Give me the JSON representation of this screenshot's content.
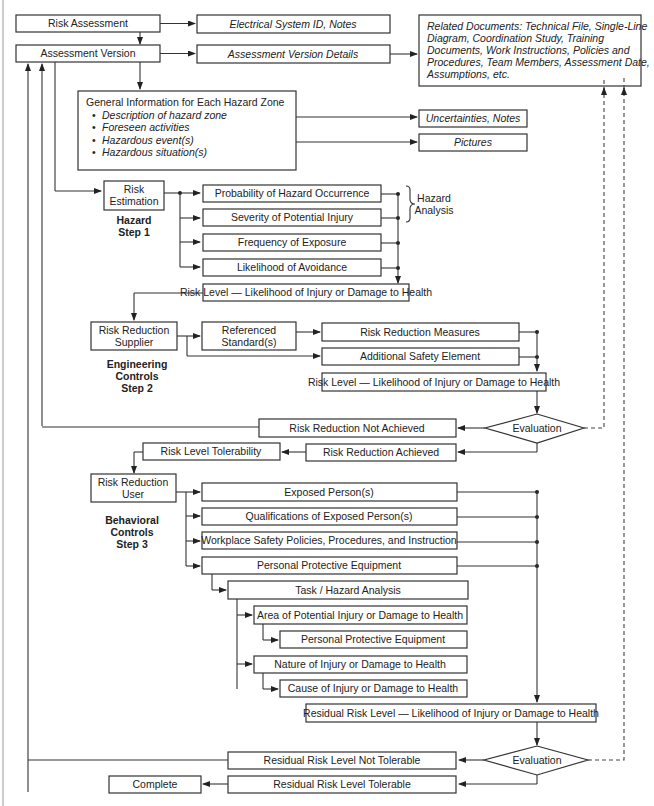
{
  "diagram": {
    "nodes": {
      "risk_assessment": "Risk Assessment",
      "electrical_system_id": "Electrical System ID, Notes",
      "assessment_version": "Assessment Version",
      "assessment_version_details": "Assessment Version Details",
      "related_documents": [
        "Related Documents: Technical File, Single-Line",
        "Diagram, Coordination Study, Training",
        "Documents, Work Instructions, Policies and",
        "Procedures, Team Members, Assessment Date,",
        "Assumptions, etc."
      ],
      "general_info": {
        "title": "General Information for Each Hazard Zone",
        "bullets": [
          "Description of hazard zone",
          "Foreseen activities",
          "Hazardous event(s)",
          "Hazardous situation(s)"
        ]
      },
      "uncertainties_notes": "Uncertainties, Notes",
      "pictures": "Pictures",
      "risk_estimation": [
        "Risk",
        "Estimation"
      ],
      "step1_label": [
        "Hazard",
        "Step 1"
      ],
      "probability": "Probability of Hazard Occurrence",
      "severity": "Severity of Potential Injury",
      "hazard_analysis": [
        "Hazard",
        "Analysis"
      ],
      "frequency": "Frequency of Exposure",
      "avoidance": "Likelihood of Avoidance",
      "risk_level_1": "Risk Level — Likelihood of Injury or Damage to Health",
      "risk_reduction_supplier": [
        "Risk Reduction",
        "Supplier"
      ],
      "step2_label": [
        "Engineering",
        "Controls",
        "Step 2"
      ],
      "referenced_standards": [
        "Referenced",
        "Standard(s)"
      ],
      "risk_reduction_measures": "Risk Reduction Measures",
      "additional_safety": "Additional Safety Element",
      "risk_level_2": "Risk Level — Likelihood of Injury or Damage to Health",
      "evaluation_1": "Evaluation",
      "not_achieved": "Risk Reduction Not Achieved",
      "achieved": "Risk Reduction Achieved",
      "tolerability": "Risk Level Tolerability",
      "risk_reduction_user": [
        "Risk Reduction",
        "User"
      ],
      "step3_label": [
        "Behavioral",
        "Controls",
        "Step 3"
      ],
      "exposed_persons": "Exposed Person(s)",
      "qualifications": "Qualifications of Exposed Person(s)",
      "workplace_policies": "Workplace Safety Policies, Procedures, and Instruction",
      "ppe_1": "Personal Protective Equipment",
      "task_hazard": "Task / Hazard Analysis",
      "area_injury": "Area of Potential Injury or Damage to Health",
      "ppe_2": "Personal Protective Equipment",
      "nature_injury": "Nature of Injury or Damage to Health",
      "cause_injury": "Cause of Injury or Damage to Health",
      "residual_risk_level": "Residual Risk Level — Likelihood of Injury or Damage to Health",
      "evaluation_2": "Evaluation",
      "residual_not_tolerable": "Residual Risk Level Not Tolerable",
      "residual_tolerable": "Residual Risk Level Tolerable",
      "complete": "Complete"
    }
  }
}
